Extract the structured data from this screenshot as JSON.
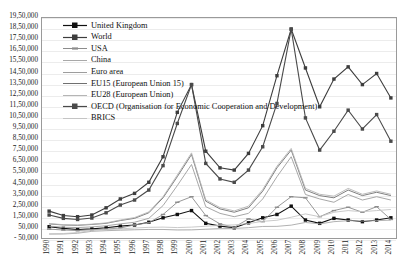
{
  "chart_data": {
    "type": "line",
    "title": "",
    "xlabel": "",
    "ylabel": "",
    "grid": true,
    "legend_position": "top-left-inside",
    "ylim": [
      -50000,
      1950000
    ],
    "y_tick_labels": [
      "19,50,000",
      "18,50,000",
      "17,50,000",
      "16,50,000",
      "15,50,000",
      "14,50,000",
      "13,50,000",
      "12,50,000",
      "11,50,000",
      "10,50,000",
      "9,50,000",
      "8,50,000",
      "7,50,000",
      "6,50,000",
      "5,50,000",
      "4,50,000",
      "3,50,000",
      "2,50,000",
      "1,50,000",
      "50,000",
      "- 50,000"
    ],
    "y_tick_values": [
      1950000,
      1850000,
      1750000,
      1650000,
      1550000,
      1450000,
      1350000,
      1250000,
      1150000,
      1050000,
      950000,
      850000,
      750000,
      650000,
      550000,
      450000,
      350000,
      250000,
      150000,
      50000,
      -50000
    ],
    "categories": [
      "1990",
      "1991",
      "1992",
      "1993",
      "1994",
      "1995",
      "1996",
      "1997",
      "1998",
      "1999",
      "2000",
      "2001",
      "2002",
      "2003",
      "2004",
      "2005",
      "2006",
      "2007",
      "2008",
      "2009",
      "2010",
      "2011",
      "2012",
      "2013",
      "2014"
    ],
    "series": [
      {
        "name": "United Kingdom",
        "color": "#101010",
        "marker": "square",
        "values": [
          70000,
          55000,
          45000,
          50000,
          60000,
          75000,
          85000,
          110000,
          150000,
          180000,
          215000,
          100000,
          75000,
          60000,
          105000,
          150000,
          180000,
          255000,
          130000,
          100000,
          145000,
          130000,
          115000,
          130000,
          150000
        ]
      },
      {
        "name": "World",
        "color": "#3d3d3d",
        "marker": "square",
        "values": [
          210000,
          170000,
          160000,
          175000,
          240000,
          320000,
          370000,
          470000,
          700000,
          1100000,
          1350000,
          750000,
          600000,
          580000,
          730000,
          980000,
          1430000,
          1850000,
          1500000,
          1150000,
          1400000,
          1510000,
          1350000,
          1450000,
          1230000
        ]
      },
      {
        "name": "USA",
        "color": "#8c8c8c",
        "marker": "dash",
        "values": [
          48000,
          40000,
          35000,
          43000,
          48000,
          58000,
          86000,
          105000,
          180000,
          290000,
          340000,
          170000,
          95000,
          65000,
          140000,
          115000,
          245000,
          340000,
          330000,
          160000,
          215000,
          245000,
          200000,
          250000,
          135000
        ]
      },
      {
        "name": "China",
        "color": "#a8a8a8",
        "marker": "none",
        "values": [
          3000,
          4000,
          11000,
          28000,
          34000,
          38000,
          42000,
          45000,
          45000,
          40000,
          41000,
          47000,
          53000,
          54000,
          61000,
          72000,
          73000,
          84000,
          108000,
          95000,
          115000,
          124000,
          121000,
          124000,
          129000
        ]
      },
      {
        "name": "Euro area",
        "color": "#9d9d9d",
        "marker": "none",
        "values": [
          75000,
          65000,
          62000,
          68000,
          78000,
          95000,
          110000,
          145000,
          260000,
          440000,
          630000,
          250000,
          190000,
          160000,
          190000,
          320000,
          520000,
          700000,
          360000,
          320000,
          290000,
          360000,
          310000,
          340000,
          310000
        ]
      },
      {
        "name": "EU15 (European Union 15)",
        "color": "#707070",
        "marker": "none",
        "values": [
          95000,
          85000,
          82000,
          90000,
          100000,
          125000,
          145000,
          195000,
          330000,
          520000,
          720000,
          300000,
          230000,
          200000,
          240000,
          390000,
          600000,
          760000,
          400000,
          350000,
          330000,
          400000,
          350000,
          380000,
          350000
        ]
      },
      {
        "name": "EU28 (European Union)",
        "color": "#b5b5b5",
        "marker": "none",
        "values": [
          98000,
          88000,
          85000,
          93000,
          104000,
          130000,
          152000,
          203000,
          340000,
          535000,
          735000,
          312000,
          242000,
          212000,
          255000,
          405000,
          615000,
          775000,
          415000,
          362000,
          345000,
          415000,
          362000,
          392000,
          362000
        ]
      },
      {
        "name": "OECD (Organisation for Economic Cooperation and Development)",
        "color": "#4a4a4a",
        "marker": "square",
        "values": [
          175000,
          145000,
          135000,
          148000,
          195000,
          265000,
          310000,
          400000,
          620000,
          1000000,
          1350000,
          640000,
          500000,
          470000,
          580000,
          790000,
          1180000,
          1850000,
          1050000,
          760000,
          930000,
          1120000,
          950000,
          1080000,
          840000
        ]
      },
      {
        "name": "BRICS",
        "color": "#c4c4c4",
        "marker": "none",
        "values": [
          6000,
          8000,
          17000,
          36000,
          44000,
          50000,
          58000,
          64000,
          66000,
          62000,
          66000,
          74000,
          82000,
          86000,
          98000,
          118000,
          128000,
          155000,
          185000,
          160000,
          200000,
          215000,
          205000,
          215000,
          225000
        ]
      }
    ]
  }
}
